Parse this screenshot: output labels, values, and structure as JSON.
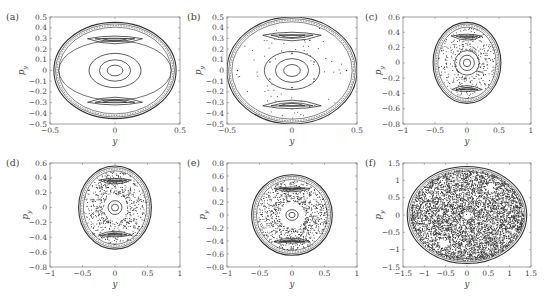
{
  "figure": {
    "background": "#ffffff",
    "ink_color": "#333333",
    "axis_color": "#888888"
  },
  "chart_data": [
    {
      "panel_label": "(a)",
      "type": "scatter",
      "subtype": "poincare_section",
      "xlabel": "y",
      "ylabel": "p_y",
      "xlim": [
        -0.5,
        0.5
      ],
      "ylim": [
        -0.5,
        0.5
      ],
      "xticks": [
        "-0.5",
        "0",
        "0.5"
      ],
      "yticks": [
        "0.5",
        "0.4",
        "0.3",
        "0.2",
        "0.1",
        "0",
        "-0.1",
        "-0.2",
        "-0.3",
        "-0.4",
        "-0.5"
      ],
      "grid": false,
      "description": "Regular invariant tori: nested ellipses about the origin, two crescent islands near p_y = ±0.3, outer boundary ellipse of radius ≈0.47 in y, ≈0.45 in p_y",
      "boundary": {
        "ry": 0.47,
        "rp": 0.45
      },
      "islands": [
        {
          "cy": 0,
          "cp": 0,
          "rx": 0.06,
          "ry": 0.05,
          "type": "ellipse"
        },
        {
          "cy": 0,
          "cp": 0,
          "rx": 0.12,
          "ry": 0.1,
          "type": "ellipse"
        },
        {
          "cy": 0,
          "cp": 0,
          "rx": 0.2,
          "ry": 0.16,
          "type": "ellipse"
        },
        {
          "cy": 0,
          "cp": 0.3,
          "rx": 0.14,
          "ry": 0.04,
          "type": "crescent"
        },
        {
          "cy": 0,
          "cp": -0.3,
          "rx": 0.14,
          "ry": 0.04,
          "type": "crescent"
        }
      ]
    },
    {
      "panel_label": "(b)",
      "type": "scatter",
      "subtype": "poincare_section",
      "xlabel": "y",
      "ylabel": "p_y",
      "xlim": [
        -0.5,
        0.5
      ],
      "ylim": [
        -0.5,
        0.5
      ],
      "xticks": [
        "-0.5",
        "0",
        "0.5"
      ],
      "yticks": [
        "0.5",
        "0.4",
        "0.3",
        "0.2",
        "0.1",
        "0",
        "-0.1",
        "-0.2",
        "-0.3",
        "-0.4",
        "-0.5"
      ],
      "grid": false,
      "description": "Mostly regular: large upper/lower crescent islands, central small island chain, scattered isolated points; boundary ≈0.5",
      "boundary": {
        "ry": 0.5,
        "rp": 0.5
      }
    },
    {
      "panel_label": "(c)",
      "type": "scatter",
      "subtype": "poincare_section",
      "xlabel": "y",
      "ylabel": "p_y",
      "xlim": [
        -1,
        1
      ],
      "ylim": [
        -0.8,
        0.6
      ],
      "xticks": [
        "-1",
        "-0.5",
        "0",
        "0.5",
        "1"
      ],
      "yticks": [
        "0.6",
        "0.4",
        "0.2",
        "0",
        "-0.2",
        "-0.4",
        "-0.6",
        "-0.8"
      ],
      "grid": false,
      "description": "Onset of chaos: chaotic band near separatrix at y ≈ ±0.4, central island and two crescent islands; boundary ≈0.53",
      "boundary": {
        "ry": 0.53,
        "rp": 0.53
      }
    },
    {
      "panel_label": "(d)",
      "type": "scatter",
      "subtype": "poincare_section",
      "xlabel": "y",
      "ylabel": "p_y",
      "xlim": [
        -1,
        1
      ],
      "ylim": [
        -0.8,
        0.6
      ],
      "xticks": [
        "-1",
        "-0.5",
        "0",
        "0.5",
        "1"
      ],
      "yticks": [
        "0.6",
        "0.4",
        "0.2",
        "0",
        "-0.2",
        "-0.4",
        "-0.6",
        "-0.8"
      ],
      "grid": false,
      "description": "Wider chaotic region surrounding central island; crescent islands near p_y = ±0.4; boundary ≈0.56",
      "boundary": {
        "ry": 0.56,
        "rp": 0.56
      }
    },
    {
      "panel_label": "(e)",
      "type": "scatter",
      "subtype": "poincare_section",
      "xlabel": "y",
      "ylabel": "p_y",
      "xlim": [
        -1,
        1
      ],
      "ylim": [
        -0.8,
        0.8
      ],
      "xticks": [
        "-1",
        "-0.5",
        "0",
        "0.5",
        "1"
      ],
      "yticks": [
        "0.8",
        "0.6",
        "0.4",
        "0.2",
        "0",
        "-0.2",
        "-0.4",
        "-0.6",
        "-0.8"
      ],
      "grid": false,
      "description": "Extensive chaos; small central island and thin crescent islands near p_y = ±0.5; boundary ≈0.62",
      "boundary": {
        "ry": 0.62,
        "rp": 0.62
      }
    },
    {
      "panel_label": "(f)",
      "type": "scatter",
      "subtype": "poincare_section",
      "xlabel": "y",
      "ylabel": "p_y",
      "xlim": [
        -1.5,
        1.5
      ],
      "ylim": [
        -1.5,
        1.5
      ],
      "xticks": [
        "-1.5",
        "-1",
        "-0.5",
        "0",
        "0.5",
        "1",
        "1.5"
      ],
      "yticks": [
        "1.5",
        "1",
        "0.5",
        "0",
        "-0.5",
        "-1",
        "-1.5"
      ],
      "grid": false,
      "description": "Fully chaotic sea filling disk of radius ≈1.4; tiny regular spots near origin and at (±0.55, ±0.8)",
      "boundary": {
        "ry": 1.4,
        "rp": 1.4
      }
    }
  ]
}
